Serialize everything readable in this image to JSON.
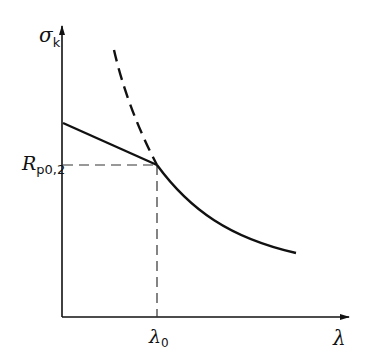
{
  "diagram": {
    "y_axis": {
      "symbol": "σ",
      "subscript": "k"
    },
    "x_axis": {
      "symbol": "λ"
    },
    "y_marker": {
      "symbol": "R",
      "subscript": "p0,2"
    },
    "x_marker": {
      "symbol": "λ",
      "subscript": "0"
    },
    "curves": [
      {
        "name": "linear-inelastic-line",
        "style": "solid"
      },
      {
        "name": "euler-hyperbola",
        "style": "solid-after-intersection, dashed-before"
      }
    ],
    "colors": {
      "line": "#111111",
      "background": "#ffffff"
    }
  }
}
